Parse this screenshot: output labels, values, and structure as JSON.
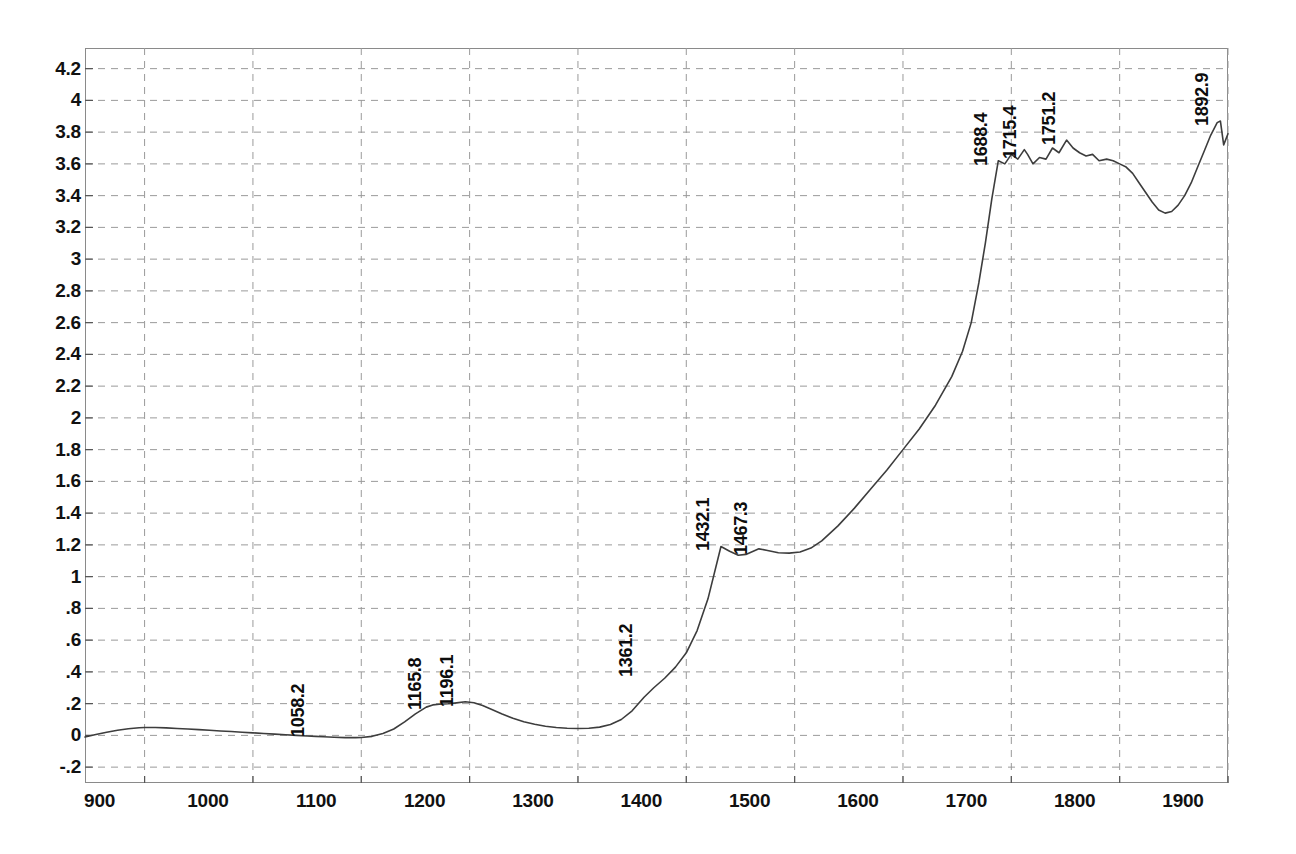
{
  "chart_data": {
    "type": "line",
    "title": "",
    "xlabel": "",
    "ylabel": "",
    "xlim": [
      845,
      1900
    ],
    "ylim": [
      -0.3,
      4.33
    ],
    "grid": true,
    "legend": null,
    "x_ticks": [
      900,
      1000,
      1100,
      1200,
      1300,
      1400,
      1500,
      1600,
      1700,
      1800,
      1900
    ],
    "y_ticks": [
      4.2,
      4,
      3.8,
      3.6,
      3.4,
      3.2,
      3,
      2.8,
      2.6,
      2.4,
      2.2,
      2,
      1.8,
      1.6,
      1.4,
      1.2,
      1,
      0.8,
      0.6,
      0.4,
      0.2,
      0,
      -0.2
    ],
    "y_tick_labels": [
      "4.2",
      "4",
      "3.8",
      "3.6",
      "3.4",
      "3.2",
      "3",
      "2.8",
      "2.6",
      "2.4",
      "2.2",
      "2",
      "1.8",
      "1.6",
      "1.4",
      "1.2",
      "1",
      ".8",
      ".6",
      ".4",
      ".2",
      "0",
      "-.2"
    ],
    "annotations": [
      {
        "label": "1058.2",
        "x": 1058.2,
        "y": 0.02
      },
      {
        "label": "1165.8",
        "x": 1165.8,
        "y": 0.19
      },
      {
        "label": "1196.1",
        "x": 1196.1,
        "y": 0.21
      },
      {
        "label": "1361.2",
        "x": 1361.2,
        "y": 0.4
      },
      {
        "label": "1432.1",
        "x": 1432.1,
        "y": 1.19
      },
      {
        "label": "1467.3",
        "x": 1467.3,
        "y": 1.17
      },
      {
        "label": "1688.4",
        "x": 1688.4,
        "y": 3.62
      },
      {
        "label": "1715.4",
        "x": 1715.4,
        "y": 3.66
      },
      {
        "label": "1751.2",
        "x": 1751.2,
        "y": 3.75
      },
      {
        "label": "1892.9",
        "x": 1892.9,
        "y": 3.87
      }
    ],
    "series": [
      {
        "name": "spectrum",
        "color": "#3d3d3d",
        "x": [
          845,
          855,
          865,
          875,
          885,
          895,
          900,
          910,
          920,
          930,
          940,
          950,
          960,
          970,
          980,
          990,
          1000,
          1010,
          1020,
          1030,
          1040,
          1050,
          1058,
          1065,
          1075,
          1085,
          1095,
          1100,
          1110,
          1120,
          1130,
          1140,
          1150,
          1160,
          1166,
          1172,
          1180,
          1188,
          1196,
          1204,
          1212,
          1220,
          1230,
          1240,
          1250,
          1260,
          1270,
          1280,
          1290,
          1300,
          1310,
          1320,
          1330,
          1340,
          1350,
          1361,
          1370,
          1380,
          1390,
          1400,
          1410,
          1420,
          1432,
          1440,
          1448,
          1455,
          1467,
          1475,
          1485,
          1495,
          1505,
          1515,
          1525,
          1540,
          1555,
          1570,
          1585,
          1600,
          1615,
          1630,
          1645,
          1655,
          1663,
          1670,
          1676,
          1682,
          1688,
          1694,
          1700,
          1706,
          1712,
          1715,
          1720,
          1726,
          1732,
          1738,
          1744,
          1751,
          1757,
          1763,
          1769,
          1775,
          1781,
          1788,
          1794,
          1800,
          1806,
          1812,
          1818,
          1824,
          1830,
          1836,
          1842,
          1848,
          1854,
          1860,
          1866,
          1872,
          1878,
          1884,
          1890,
          1893,
          1896,
          1900
        ],
        "y": [
          -0.01,
          0.005,
          0.02,
          0.032,
          0.042,
          0.048,
          0.05,
          0.05,
          0.047,
          0.043,
          0.04,
          0.036,
          0.032,
          0.028,
          0.024,
          0.02,
          0.016,
          0.012,
          0.008,
          0.004,
          0.0,
          -0.004,
          -0.006,
          -0.009,
          -0.012,
          -0.014,
          -0.014,
          -0.013,
          -0.006,
          0.012,
          0.04,
          0.085,
          0.135,
          0.178,
          0.192,
          0.196,
          0.199,
          0.205,
          0.212,
          0.205,
          0.188,
          0.165,
          0.135,
          0.108,
          0.086,
          0.07,
          0.058,
          0.05,
          0.045,
          0.043,
          0.045,
          0.052,
          0.068,
          0.1,
          0.155,
          0.24,
          0.3,
          0.36,
          0.43,
          0.52,
          0.66,
          0.86,
          1.19,
          1.16,
          1.135,
          1.14,
          1.175,
          1.165,
          1.15,
          1.148,
          1.155,
          1.18,
          1.225,
          1.32,
          1.43,
          1.55,
          1.67,
          1.8,
          1.93,
          2.08,
          2.26,
          2.42,
          2.6,
          2.85,
          3.1,
          3.38,
          3.62,
          3.6,
          3.66,
          3.63,
          3.69,
          3.66,
          3.6,
          3.64,
          3.63,
          3.7,
          3.67,
          3.75,
          3.7,
          3.67,
          3.65,
          3.66,
          3.62,
          3.63,
          3.62,
          3.6,
          3.58,
          3.54,
          3.48,
          3.42,
          3.36,
          3.31,
          3.29,
          3.3,
          3.34,
          3.4,
          3.48,
          3.58,
          3.68,
          3.78,
          3.86,
          3.87,
          3.72,
          3.79
        ]
      }
    ]
  }
}
